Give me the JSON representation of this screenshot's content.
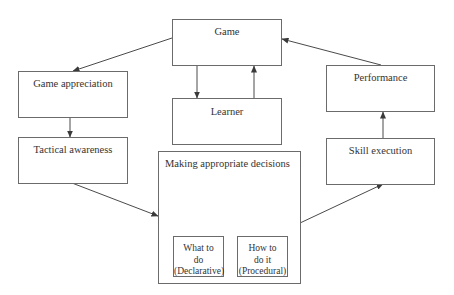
{
  "diagram": {
    "type": "flow",
    "nodes": {
      "game": {
        "label": "Game"
      },
      "game_appreciation": {
        "label": "Game appreciation"
      },
      "learner": {
        "label": "Learner"
      },
      "performance": {
        "label": "Performance"
      },
      "tactical_awareness": {
        "label": "Tactical awareness"
      },
      "decisions": {
        "label": "Making appropriate decisions",
        "children": {
          "what": {
            "line1": "What to",
            "line2": "do",
            "line3": "(Declarative)"
          },
          "how": {
            "line1": "How to",
            "line2": "do it",
            "line3": "(Procedural)"
          }
        }
      },
      "skill_execution": {
        "label": "Skill execution"
      }
    },
    "edges": [
      {
        "from": "Game",
        "to": "Game appreciation"
      },
      {
        "from": "Game",
        "to": "Learner"
      },
      {
        "from": "Learner",
        "to": "Game"
      },
      {
        "from": "Game appreciation",
        "to": "Tactical awareness"
      },
      {
        "from": "Tactical awareness",
        "to": "Making appropriate decisions"
      },
      {
        "from": "Making appropriate decisions",
        "to": "Skill execution"
      },
      {
        "from": "Skill execution",
        "to": "Performance"
      },
      {
        "from": "Performance",
        "to": "Game"
      }
    ],
    "colors": {
      "line": "#4a4a4a",
      "box_border": "#6b6b6b",
      "text": "#333333"
    }
  }
}
